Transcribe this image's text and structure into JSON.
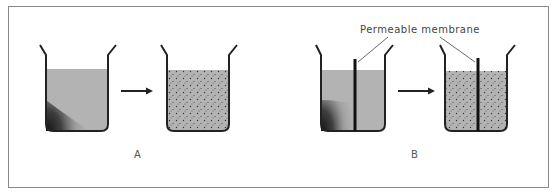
{
  "figure": {
    "panels": [
      {
        "id": "A",
        "label": "A",
        "description": "Solute diffusion in a beaker: concentrated solute in corner spreads evenly throughout the liquid",
        "before": {
          "state": "concentrated",
          "membrane": false
        },
        "after": {
          "state": "dispersed",
          "membrane": false
        }
      },
      {
        "id": "B",
        "label": "B",
        "description": "Diffusion across a permeable membrane: solute spreads to both sides",
        "before": {
          "state": "concentrated",
          "membrane": true
        },
        "after": {
          "state": "dispersed",
          "membrane": true
        }
      }
    ],
    "annotations": {
      "membrane_label": "Permeable membrane"
    },
    "colors": {
      "liquid": "#b3b3b3",
      "outline": "#222222",
      "border": "#888888",
      "dots": "#333333"
    }
  }
}
